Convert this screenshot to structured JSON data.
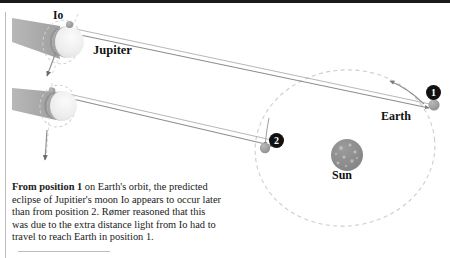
{
  "figure": {
    "title_hidden": "",
    "labels": {
      "io": "Io",
      "jupiter": "Jupiter",
      "earth": "Earth",
      "sun": "Sun"
    },
    "badges": {
      "position_1": "1",
      "position_2": "2"
    },
    "caption": {
      "lead": "From position 1",
      "body": " on Earth's orbit, the predicted eclipse of Jupitier's moon Io appears to occur later than from position 2. Rømer reasoned that this was due to the extra distance light from Io had to travel to reach Earth in position 1."
    },
    "colors": {
      "orbit_dash": "#c9c9c9",
      "sight_line": "#8d8d8d",
      "shadow_cone": "#a8a8a8",
      "planet_body": "#e9e9e9",
      "planet_dark": "#8f8f8f",
      "sun_body": "#8c8c8c",
      "sun_spot": "#b5b5b5",
      "earth_body": "#9a9a9a",
      "io_body": "#9e9e9e",
      "badge_bg": "#111111",
      "badge_text": "#ffffff",
      "frame_line": "#b9b9b9",
      "top_border": "#1b1b1b",
      "text": "#1a1a1a"
    },
    "icons": {
      "jupiter_upper": "jupiter-planet-icon",
      "jupiter_lower": "jupiter-planet-icon",
      "io_upper": "io-moon-icon",
      "io_lower": "io-moon-icon",
      "sun": "sun-icon",
      "earth_pos1": "earth-icon",
      "earth_pos2": "earth-icon",
      "shadow_upper": "shadow-cone-icon",
      "shadow_lower": "shadow-cone-icon",
      "orbit_arrow_io_upper": "arrow-down-icon",
      "orbit_arrow_io_lower": "arrow-down-icon",
      "orbit_arrow_earth": "arrow-ccw-icon",
      "orbit_arrow_earth_left": "arrow-ccw-icon"
    },
    "geometry_notes": {
      "earth_orbit": "dashed ellipse centered near the Sun, Earth travels counter-clockwise",
      "io_orbit_upper": "dashed ellipse around upper Jupiter, Io at top-left of disk",
      "io_orbit_lower": "dashed ellipse around lower Jupiter, Io at top-left of disk",
      "sight_lines": "two long lines from each Jupiter system converging at Earth position 1 and position 2"
    }
  }
}
